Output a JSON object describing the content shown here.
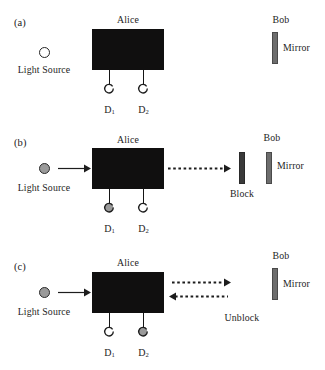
{
  "figure": {
    "colors": {
      "alice_box": "#100f0f",
      "mirror": "#6d6d6d",
      "block": "#3a3a3a",
      "detector_fill": "#9a9a9a",
      "source_fill": "#9a9a9a",
      "stroke": "#1d1d1d",
      "background": "#ffffff"
    }
  },
  "panels": [
    {
      "id": "a",
      "label": "(a)",
      "alice_title": "Alice",
      "bob_title": "Bob",
      "source_label": "Light Source",
      "source_state": "hollow",
      "mirror_label": "Mirror",
      "detectors": [
        {
          "label": "D",
          "sub": "1",
          "state": "hollow"
        },
        {
          "label": "D",
          "sub": "2",
          "state": "hollow"
        }
      ],
      "beams": [],
      "extra_label": "",
      "input_arrow": false
    },
    {
      "id": "b",
      "label": "(b)",
      "alice_title": "Alice",
      "bob_title": "Bob",
      "source_label": "Light Source",
      "source_state": "filled",
      "mirror_label": "Mirror",
      "block_label": "Block",
      "detectors": [
        {
          "label": "D",
          "sub": "1",
          "state": "filled"
        },
        {
          "label": "D",
          "sub": "2",
          "state": "hollow"
        }
      ],
      "beams": [
        {
          "direction": "right",
          "style": "dashed"
        }
      ],
      "extra_label": "Block",
      "input_arrow": true
    },
    {
      "id": "c",
      "label": "(c)",
      "alice_title": "Alice",
      "bob_title": "Bob",
      "source_label": "Light Source",
      "source_state": "filled",
      "mirror_label": "Mirror",
      "detectors": [
        {
          "label": "D",
          "sub": "1",
          "state": "hollow"
        },
        {
          "label": "D",
          "sub": "2",
          "state": "filled"
        }
      ],
      "beams": [
        {
          "direction": "right",
          "style": "dashed"
        },
        {
          "direction": "left",
          "style": "dashed"
        }
      ],
      "extra_label": "Unblock",
      "input_arrow": true
    }
  ]
}
